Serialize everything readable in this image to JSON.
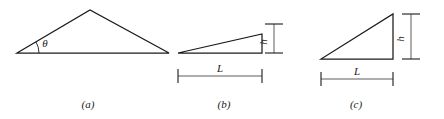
{
  "figure": {
    "background_color": "#ffffff",
    "line_color": "#1b1b1b",
    "dimension_line_color": "#4a4a4a",
    "width": 444,
    "height": 119
  },
  "panels": [
    {
      "id": "a",
      "caption": "(a)",
      "caption_x": 88,
      "caption_y": 108,
      "shape": "scalene-triangle",
      "vertices": [
        {
          "x": 17,
          "y": 53
        },
        {
          "x": 90,
          "y": 10
        },
        {
          "x": 169,
          "y": 53
        }
      ],
      "angle": {
        "symbol": "θ",
        "label_x": 45,
        "label_y": 47,
        "arc_radius": 22,
        "vertex_x": 17,
        "vertex_y": 53
      },
      "dimensions": []
    },
    {
      "id": "b",
      "caption": "(b)",
      "caption_x": 224,
      "caption_y": 108,
      "shape": "right-triangle-shallow",
      "vertices": [
        {
          "x": 178,
          "y": 53
        },
        {
          "x": 262,
          "y": 53
        },
        {
          "x": 262,
          "y": 34
        }
      ],
      "dimensions": [
        {
          "name": "h",
          "label": "h",
          "orientation": "vertical",
          "x": 274,
          "y_top": 24,
          "y_bottom": 53,
          "cap_half_width": 9,
          "label_x": 267,
          "label_y": 42
        },
        {
          "name": "L",
          "label": "L",
          "orientation": "horizontal",
          "y": 76,
          "x_left": 178,
          "x_right": 262,
          "cap_half_height": 7,
          "label_x": 220,
          "label_y": 72
        }
      ]
    },
    {
      "id": "c",
      "caption": "(c)",
      "caption_x": 356,
      "caption_y": 108,
      "shape": "right-triangle-steep",
      "vertices": [
        {
          "x": 321,
          "y": 59
        },
        {
          "x": 393,
          "y": 59
        },
        {
          "x": 393,
          "y": 14
        }
      ],
      "dimensions": [
        {
          "name": "h",
          "label": "h",
          "orientation": "vertical",
          "x": 411,
          "y_top": 14,
          "y_bottom": 59,
          "cap_half_width": 9,
          "label_x": 404,
          "label_y": 39
        },
        {
          "name": "L",
          "label": "L",
          "orientation": "horizontal",
          "y": 79,
          "x_left": 321,
          "x_right": 393,
          "cap_half_height": 7,
          "label_x": 357,
          "label_y": 75
        }
      ]
    }
  ]
}
